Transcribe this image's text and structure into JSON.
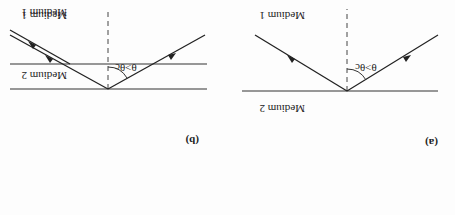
{
  "figure": {
    "orientation": "rotated 180 degrees",
    "panels": [
      {
        "id": "a",
        "label": "(a)",
        "title": "Total internal reflection at boundary",
        "medium_top": "Medium 2",
        "medium_bottom": "Medium 1",
        "angle_condition": "θ>θc",
        "angle_symbol": "θ",
        "critical_symbol": "θc"
      },
      {
        "id": "b",
        "label": "(b)",
        "title": "Frustrated total internal reflection (thin Medium 2 layer)",
        "medium_top": "Medium 1",
        "medium_middle": "Medium 2",
        "medium_bottom": "Medium 1",
        "angle_condition": "θ>θc",
        "angle_symbol": "θ",
        "critical_symbol": "θc"
      }
    ]
  }
}
